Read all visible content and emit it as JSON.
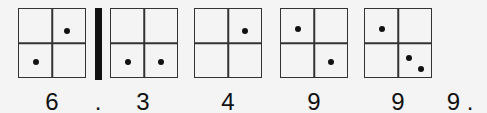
{
  "diagram": {
    "boxes": [
      {
        "id": "box-1",
        "left": 18,
        "dots": [
          [
            0.72,
            0.32
          ],
          [
            0.25,
            0.78
          ]
        ],
        "label": "6",
        "label_x": 52
      },
      {
        "id": "box-2",
        "left": 110,
        "dots": [
          [
            0.25,
            0.78
          ],
          [
            0.75,
            0.78
          ]
        ],
        "label": "3",
        "label_x": 143
      },
      {
        "id": "box-3",
        "left": 194,
        "dots": [
          [
            0.75,
            0.32
          ]
        ],
        "label": "4",
        "label_x": 228
      },
      {
        "id": "box-4",
        "left": 280,
        "dots": [
          [
            0.25,
            0.3
          ],
          [
            0.75,
            0.78
          ]
        ],
        "label": "9",
        "label_x": 314
      },
      {
        "id": "box-5",
        "left": 364,
        "dots": [
          [
            0.25,
            0.3
          ],
          [
            0.67,
            0.72
          ],
          [
            0.85,
            0.88
          ]
        ],
        "label": "9",
        "label_x": 398
      }
    ],
    "decimal_point": {
      "label": ".",
      "x": 98
    },
    "trailing": {
      "label": "9 .",
      "x": 458
    }
  }
}
